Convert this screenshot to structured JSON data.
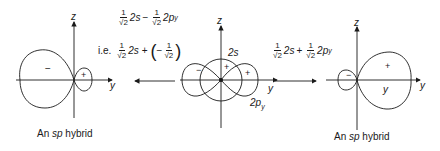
{
  "diagram": {
    "left_hybrid": {
      "caption_prefix": "An ",
      "caption_italic": "sp",
      "caption_suffix": " hybrid",
      "axis_z": "z",
      "axis_y": "y",
      "big_lobe_sign": "−",
      "small_lobe_sign": "+"
    },
    "center": {
      "axis_z": "z",
      "axis_y": "y",
      "s_label": "2s",
      "p_label": "2p",
      "p_subscript": "y",
      "s_sign": "+",
      "p_neg_sign": "−",
      "p_pos_sign": "+"
    },
    "right_hybrid": {
      "caption_prefix": "An ",
      "caption_italic": "sp",
      "caption_suffix": " hybrid",
      "axis_z": "z",
      "axis_y": "y",
      "inner_label": "y",
      "big_lobe_sign": "+",
      "small_lobe_sign": "−"
    },
    "left_equation": {
      "line1": {
        "frac1_num": "1",
        "frac1_den": "√2",
        "term1": "2s",
        "op": "−",
        "frac2_num": "1",
        "frac2_den": "√2",
        "term2": "2p",
        "term2_sub": "y"
      },
      "line2": {
        "prefix": "i.e.",
        "frac1_num": "1",
        "frac1_den": "√2",
        "term1": "2s",
        "op": "+",
        "open_paren": "(",
        "neg": "−",
        "frac2_num": "1",
        "frac2_den": "√2",
        "close_paren": ")"
      },
      "arrow_direction": "left"
    },
    "right_equation": {
      "frac1_num": "1",
      "frac1_den": "√2",
      "term1": "2s",
      "op": "+",
      "frac2_num": "1",
      "frac2_den": "√2",
      "term2": "2p",
      "term2_sub": "y",
      "arrow_direction": "right"
    },
    "colors": {
      "line": "#1a1a1a",
      "background": "#ffffff"
    }
  }
}
